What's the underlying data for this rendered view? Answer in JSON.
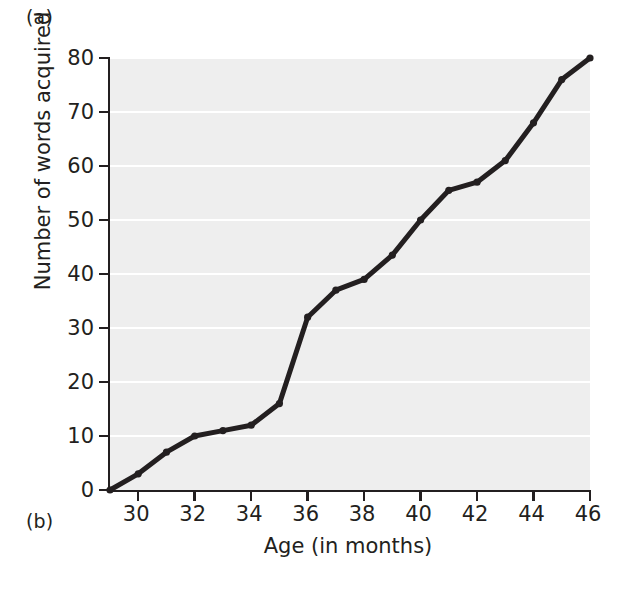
{
  "figure": {
    "panel_a_label": "(a)",
    "panel_b_label": "(b)"
  },
  "chart_data": {
    "type": "line",
    "title": "",
    "xlabel": "Age (in months)",
    "ylabel": "Number of words acquired",
    "xlim": [
      29,
      46
    ],
    "ylim": [
      0,
      80
    ],
    "xticks": [
      30,
      32,
      34,
      36,
      38,
      40,
      42,
      44,
      46
    ],
    "yticks": [
      0,
      10,
      20,
      30,
      40,
      50,
      60,
      70,
      80
    ],
    "grid": "horizontal-white",
    "legend": null,
    "line_color": "#231f20",
    "plot_background": "#eeeeee",
    "x": [
      29,
      30,
      31,
      32,
      33,
      34,
      35,
      36,
      37,
      38,
      39,
      40,
      41,
      42,
      43,
      44,
      45,
      46
    ],
    "values": [
      0,
      3,
      7,
      10,
      11,
      12,
      16,
      32,
      37,
      39,
      43.5,
      50,
      55.5,
      57,
      61,
      68,
      76,
      80
    ],
    "series": [
      {
        "name": "Number of words acquired",
        "values": [
          0,
          3,
          7,
          10,
          11,
          12,
          16,
          32,
          37,
          39,
          43.5,
          50,
          55.5,
          57,
          61,
          68,
          76,
          80
        ]
      }
    ]
  }
}
